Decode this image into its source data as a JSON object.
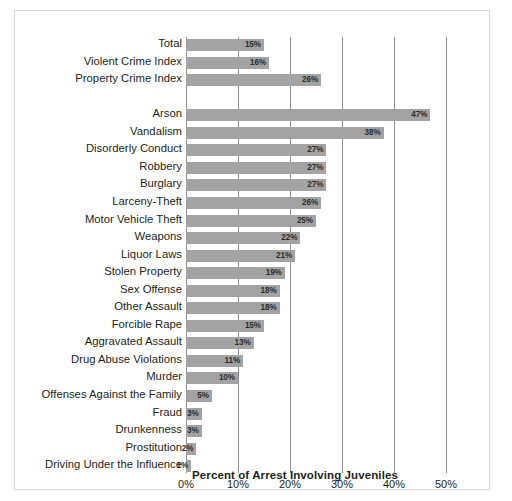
{
  "chart_data": {
    "type": "bar",
    "orientation": "horizontal",
    "title": "",
    "xlabel": "Percent of Arrest Involving Juveniles",
    "ylabel": "",
    "xlim": [
      0,
      50
    ],
    "xticks": [
      "0%",
      "10%",
      "20%",
      "30%",
      "40%",
      "50%"
    ],
    "xtick_values": [
      0,
      10,
      20,
      30,
      40,
      50
    ],
    "grid": true,
    "legend": "none",
    "bar_color": "#a3a3a3",
    "value_label_suffix": "%",
    "categories": [
      "Total",
      "Violent Crime Index",
      "Property Crime Index",
      "",
      "Arson",
      "Vandalism",
      "Disorderly Conduct",
      "Robbery",
      "Burglary",
      "Larceny-Theft",
      "Motor Vehicle Theft",
      "Weapons",
      "Liquor Laws",
      "Stolen Property",
      "Sex Offense",
      "Other Assault",
      "Forcible Rape",
      "Aggravated Assault",
      "Drug Abuse Violations",
      "Murder",
      "Offenses Against the Family",
      "Fraud",
      "Drunkenness",
      "Prostitution",
      "Driving Under the Influence"
    ],
    "values": [
      15,
      16,
      26,
      null,
      47,
      38,
      27,
      27,
      27,
      26,
      25,
      22,
      21,
      19,
      18,
      18,
      15,
      13,
      11,
      10,
      5,
      3,
      3,
      2,
      1
    ],
    "value_labels": [
      "15%",
      "16%",
      "26%",
      "",
      "47%",
      "38%",
      "27%",
      "27%",
      "27%",
      "26%",
      "25%",
      "22%",
      "21%",
      "19%",
      "18%",
      "18%",
      "15%",
      "13%",
      "11%",
      "10%",
      "5%",
      "3%",
      "3%",
      "2%",
      "1%"
    ]
  }
}
